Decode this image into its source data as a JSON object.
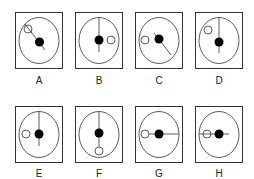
{
  "diagram": {
    "colors": {
      "stroke": "#333333",
      "fill_dot": "#000000",
      "background": "#ffffff"
    },
    "panels": [
      {
        "label": "A",
        "line": "diagonal from upper-left to lower-right through center",
        "hollow_circle": "upper-left on the line"
      },
      {
        "label": "B",
        "line": "vertical from top of ellipse to below center",
        "hollow_circle": "right of center"
      },
      {
        "label": "C",
        "line": "diagonal from near center to lower-right",
        "hollow_circle": "left of center"
      },
      {
        "label": "D",
        "line": "vertical from top of ellipse to below center",
        "hollow_circle": "upper-left"
      },
      {
        "label": "E",
        "line": "vertical from top of ellipse to below center",
        "hollow_circle": "left of center"
      },
      {
        "label": "F",
        "line": "vertical from top of ellipse to bottom",
        "hollow_circle": "bottom on the line"
      },
      {
        "label": "G",
        "line": "horizontal from hollow circle to right edge of ellipse",
        "hollow_circle": "left on the line"
      },
      {
        "label": "H",
        "line": "horizontal from left edge of ellipse to right of center",
        "hollow_circle": "left on the line"
      }
    ]
  }
}
